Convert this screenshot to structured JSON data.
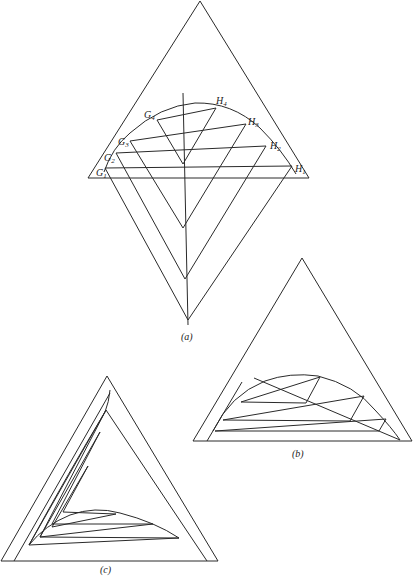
{
  "figure": {
    "panels": [
      {
        "id": "a",
        "caption": "(a)",
        "description": "Ternary triangle with binodal curve, tie lines G1H1–G4H4 and conjugate construction lines forming nested V shapes below the base",
        "tie_lines": [
          {
            "g": "G",
            "g_sub": "1",
            "h": "H",
            "h_sub": "1"
          },
          {
            "g": "G",
            "g_sub": "2",
            "h": "H",
            "h_sub": "2"
          },
          {
            "g": "G",
            "g_sub": "3",
            "h": "H",
            "h_sub": "3"
          },
          {
            "g": "G",
            "g_sub": "4",
            "h": "H",
            "h_sub": "4"
          }
        ]
      },
      {
        "id": "b",
        "caption": "(b)",
        "description": "Ternary triangle with binodal curve, tie lines and conjugate line construction"
      },
      {
        "id": "c",
        "caption": "(c)",
        "description": "Ternary triangle with inner nested triangles and binodal curve construction"
      }
    ],
    "footer_text_fragment": "(caption text cut off at bottom edge)"
  }
}
